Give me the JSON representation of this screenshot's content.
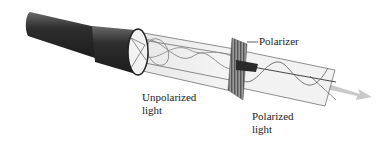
{
  "diagram": {
    "labels": {
      "polarizer": "Polarizer",
      "unpolarized_line1": "Unpolarized",
      "unpolarized_line2": "light",
      "polarized_line1": "Polarized",
      "polarized_line2": "light"
    },
    "components": [
      {
        "id": "flashlight",
        "description": "Flashlight emitting light"
      },
      {
        "id": "unpolarized-beam",
        "description": "Beam with waves oscillating in multiple planes"
      },
      {
        "id": "polarizer",
        "description": "Polarizer filter with vertical grating lines"
      },
      {
        "id": "polarized-beam",
        "description": "Beam with wave oscillating in a single plane"
      },
      {
        "id": "direction-arrow",
        "description": "Arrow showing propagation direction"
      }
    ],
    "colors": {
      "flashlight_body": "#3a3a3a",
      "beam_fill": "#eeeeee",
      "polarizer": "#7a7a7a",
      "arrow": "#c8c8c8",
      "line": "#333333"
    }
  }
}
